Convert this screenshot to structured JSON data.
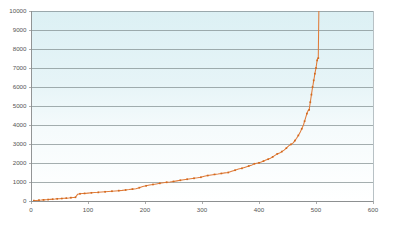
{
  "chart_data": {
    "type": "line",
    "title": "",
    "subtitle": "",
    "xlabel": "",
    "ylabel": "",
    "xlim": [
      0,
      600
    ],
    "ylim": [
      0,
      10000
    ],
    "xticks": [
      0,
      100,
      200,
      300,
      400,
      500,
      600
    ],
    "yticks": [
      0,
      1000,
      2000,
      3000,
      4000,
      5000,
      6000,
      7000,
      8000,
      9000,
      10000
    ],
    "xtick_labels": [
      "0",
      "100",
      "200",
      "300",
      "400",
      "500",
      "600"
    ],
    "ytick_labels": [
      "0",
      "1000",
      "2000",
      "3000",
      "4000",
      "5000",
      "6000",
      "7000",
      "8000",
      "9000",
      "10000"
    ],
    "grid": {
      "horizontal": true,
      "vertical": false
    },
    "legend": {
      "visible": false,
      "position": "none"
    },
    "annotations": [],
    "colors": {
      "line": "#e07b39",
      "marker": "#d2691e",
      "gridline": "#7f8c8d",
      "plot_bg_top": "#dcf0f4",
      "plot_bg_bottom": "#ffffff",
      "page_bg": "#ffffff",
      "tick_text": "#555555",
      "axis": "#8a8a8a"
    },
    "series": [
      {
        "name": "series-1",
        "marker": "square",
        "points": [
          [
            5,
            20
          ],
          [
            10,
            30
          ],
          [
            14,
            45
          ],
          [
            18,
            50
          ],
          [
            22,
            60
          ],
          [
            26,
            70
          ],
          [
            30,
            75
          ],
          [
            34,
            85
          ],
          [
            38,
            95
          ],
          [
            42,
            100
          ],
          [
            46,
            115
          ],
          [
            50,
            120
          ],
          [
            54,
            130
          ],
          [
            58,
            140
          ],
          [
            62,
            150
          ],
          [
            66,
            160
          ],
          [
            70,
            175
          ],
          [
            74,
            185
          ],
          [
            78,
            195
          ],
          [
            82,
            360
          ],
          [
            86,
            380
          ],
          [
            90,
            395
          ],
          [
            94,
            400
          ],
          [
            100,
            415
          ],
          [
            106,
            430
          ],
          [
            112,
            445
          ],
          [
            118,
            455
          ],
          [
            124,
            470
          ],
          [
            130,
            485
          ],
          [
            136,
            500
          ],
          [
            142,
            515
          ],
          [
            148,
            530
          ],
          [
            154,
            545
          ],
          [
            160,
            560
          ],
          [
            166,
            580
          ],
          [
            172,
            600
          ],
          [
            178,
            625
          ],
          [
            184,
            650
          ],
          [
            190,
            700
          ],
          [
            196,
            760
          ],
          [
            202,
            800
          ],
          [
            208,
            840
          ],
          [
            214,
            870
          ],
          [
            220,
            900
          ],
          [
            226,
            930
          ],
          [
            232,
            960
          ],
          [
            238,
            985
          ],
          [
            244,
            1000
          ],
          [
            250,
            1030
          ],
          [
            256,
            1060
          ],
          [
            262,
            1090
          ],
          [
            268,
            1120
          ],
          [
            274,
            1145
          ],
          [
            280,
            1170
          ],
          [
            286,
            1195
          ],
          [
            292,
            1220
          ],
          [
            298,
            1250
          ],
          [
            304,
            1300
          ],
          [
            310,
            1340
          ],
          [
            316,
            1370
          ],
          [
            322,
            1400
          ],
          [
            328,
            1420
          ],
          [
            334,
            1450
          ],
          [
            340,
            1480
          ],
          [
            346,
            1500
          ],
          [
            352,
            1560
          ],
          [
            358,
            1620
          ],
          [
            364,
            1680
          ],
          [
            370,
            1720
          ],
          [
            376,
            1780
          ],
          [
            382,
            1840
          ],
          [
            388,
            1900
          ],
          [
            392,
            1960
          ],
          [
            396,
            1990
          ],
          [
            400,
            2010
          ],
          [
            404,
            2050
          ],
          [
            408,
            2100
          ],
          [
            412,
            2160
          ],
          [
            416,
            2200
          ],
          [
            420,
            2250
          ],
          [
            424,
            2320
          ],
          [
            428,
            2400
          ],
          [
            432,
            2480
          ],
          [
            436,
            2520
          ],
          [
            440,
            2600
          ],
          [
            444,
            2680
          ],
          [
            448,
            2780
          ],
          [
            452,
            2900
          ],
          [
            456,
            2980
          ],
          [
            460,
            3060
          ],
          [
            463,
            3180
          ],
          [
            466,
            3300
          ],
          [
            469,
            3450
          ],
          [
            472,
            3600
          ],
          [
            475,
            3800
          ],
          [
            478,
            4000
          ],
          [
            480,
            4200
          ],
          [
            482,
            4400
          ],
          [
            484,
            4600
          ],
          [
            486,
            4750
          ],
          [
            488,
            4800
          ],
          [
            489,
            5000
          ],
          [
            490,
            5200
          ],
          [
            491,
            5400
          ],
          [
            492,
            5600
          ],
          [
            493,
            5800
          ],
          [
            494,
            6000
          ],
          [
            495,
            6150
          ],
          [
            496,
            6350
          ],
          [
            497,
            6500
          ],
          [
            498,
            6700
          ],
          [
            499,
            6850
          ],
          [
            500,
            7000
          ],
          [
            501,
            7200
          ],
          [
            502,
            7400
          ],
          [
            503,
            7500
          ],
          [
            504,
            7520
          ],
          [
            505,
            10000
          ]
        ]
      }
    ]
  }
}
